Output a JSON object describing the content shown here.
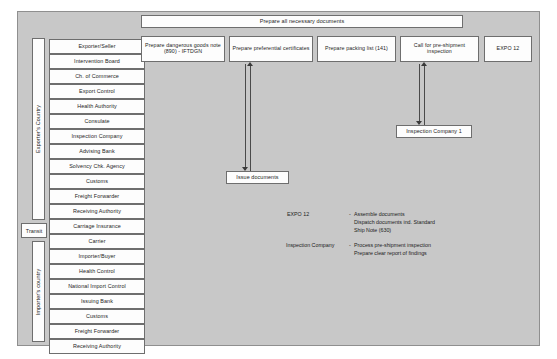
{
  "diagram": {
    "panel_color": "#c8c8c8",
    "box_color": "#fdfdfd",
    "line_color": "#4a4a4a"
  },
  "banner": {
    "label": "Prepare all necessary documents"
  },
  "top_row": [
    {
      "label": "Prepare dangerous goods note (890) - IFTDGN"
    },
    {
      "label": "Prepare preferential certificates"
    },
    {
      "label": "Prepare packing list (141)"
    },
    {
      "label": "Call for pre-shipment inspection"
    },
    {
      "label": "EXPO 12"
    }
  ],
  "mid_boxes": [
    {
      "label": "Issue documents"
    },
    {
      "label": "Inspection Company 1"
    }
  ],
  "swimlanes": [
    {
      "label": "Exporter's Country"
    },
    {
      "label": "Transit"
    },
    {
      "label": "Importer's country"
    }
  ],
  "exporter_actors": [
    {
      "label": "Exporter/Seller"
    },
    {
      "label": "Intervention Board"
    },
    {
      "label": "Ch. of Commerce"
    },
    {
      "label": "Export Control"
    },
    {
      "label": "Health Authority"
    },
    {
      "label": "Consulate"
    },
    {
      "label": "Inspection Company"
    },
    {
      "label": "Advising Bank"
    },
    {
      "label": "Solvency Chk. Agency"
    },
    {
      "label": "Customs"
    },
    {
      "label": "Freight Forwarder"
    },
    {
      "label": "Receiving Authority"
    },
    {
      "label": "Carriage Insurance"
    }
  ],
  "transit_actors": [
    {
      "label": "Carrier"
    }
  ],
  "importer_actors": [
    {
      "label": "Importer/Buyer"
    },
    {
      "label": "Health Control"
    },
    {
      "label": "National Import Control"
    },
    {
      "label": "Issuing Bank"
    },
    {
      "label": "Customs"
    },
    {
      "label": "Freight Forwarder"
    },
    {
      "label": "Receiving Authority"
    }
  ],
  "legend": [
    {
      "key": "EXPO 12",
      "dash": "-",
      "lines": [
        "Assemble documents",
        "Dispatch documents ind. Standard",
        "Ship Note (630)"
      ]
    },
    {
      "key": "Inspection Company",
      "dash": "-",
      "lines": [
        "Process pre-shipment inspection",
        "Prepare clear report of findings"
      ]
    }
  ]
}
